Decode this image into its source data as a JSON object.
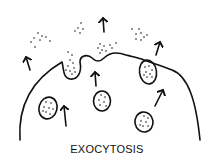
{
  "diagram": {
    "title": "EXOCYTOSIS",
    "colors": {
      "ink": "#111111",
      "background": "#ffffff"
    },
    "elements": {
      "cell_membrane": "cell-membrane",
      "vesicles": [
        {
          "id": "vesicle-left",
          "state": "inside-cell"
        },
        {
          "id": "vesicle-center",
          "state": "inside-cell"
        },
        {
          "id": "vesicle-right",
          "state": "inside-cell"
        },
        {
          "id": "vesicle-fusing",
          "state": "fusing-with-membrane"
        }
      ],
      "release_pockets": [
        {
          "id": "release-pocket-left",
          "state": "releasing-contents"
        },
        {
          "id": "release-pocket-center",
          "state": "releasing-contents"
        }
      ],
      "arrows": [
        {
          "id": "arrow-outer-left",
          "direction": "up"
        },
        {
          "id": "arrow-outer-center",
          "direction": "up"
        },
        {
          "id": "arrow-outer-right",
          "direction": "up"
        },
        {
          "id": "arrow-inner-left",
          "direction": "up"
        },
        {
          "id": "arrow-inner-center",
          "direction": "up"
        },
        {
          "id": "arrow-inner-right",
          "direction": "up-right"
        }
      ],
      "secreted_particle_clusters": 4
    }
  }
}
